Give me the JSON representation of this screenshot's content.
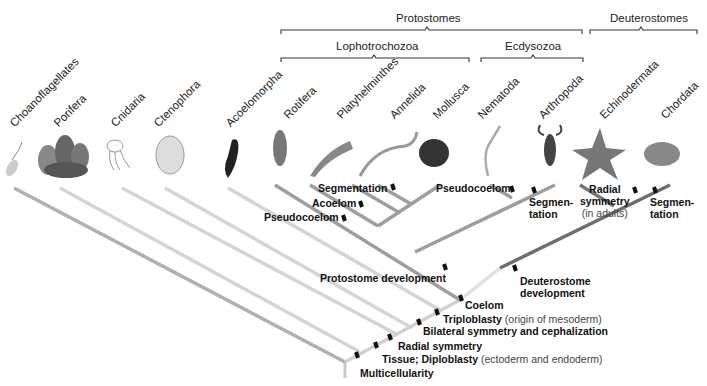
{
  "groups": {
    "protostomes": "Protostomes",
    "deuterostomes": "Deuterostomes",
    "lophotrochozoa": "Lophotrochozoa",
    "ecdysozoa": "Ecdysozoa"
  },
  "taxa": [
    {
      "name": "Choanoflagellates",
      "icon": "choanoflagellate-icon"
    },
    {
      "name": "Porifera",
      "icon": "sponge-icon"
    },
    {
      "name": "Cnidaria",
      "icon": "jellyfish-icon"
    },
    {
      "name": "Ctenophora",
      "icon": "comb-jelly-icon"
    },
    {
      "name": "Acoelomorpha",
      "icon": "acoel-worm-icon"
    },
    {
      "name": "Rotifera",
      "icon": "rotifer-icon"
    },
    {
      "name": "Platyhelminthes",
      "icon": "flatworm-icon"
    },
    {
      "name": "Annelida",
      "icon": "segmented-worm-icon"
    },
    {
      "name": "Mollusca",
      "icon": "snail-shell-icon"
    },
    {
      "name": "Nematoda",
      "icon": "roundworm-icon"
    },
    {
      "name": "Arthropoda",
      "icon": "scorpion-icon"
    },
    {
      "name": "Echinodermata",
      "icon": "starfish-icon"
    },
    {
      "name": "Chordata",
      "icon": "frog-icon"
    }
  ],
  "traits": {
    "segmentation_lopho": "Segmentation",
    "acoelom": "Acoelom",
    "pseudocoelom_lopho": "Pseudocoelom",
    "pseudocoelom_ecdy": "Pseudocoelom",
    "segmentation_arthro_1": "Segmen-",
    "segmentation_arthro_2": "tation",
    "radial_echino_1": "Radial",
    "radial_echino_2": "symmetry",
    "radial_echino_3": "(in adults)",
    "segmentation_chord_1": "Segmen-",
    "segmentation_chord_2": "tation",
    "protostome_dev": "Protostome development",
    "deuterostome_dev_1": "Deuterostome",
    "deuterostome_dev_2": "development",
    "coelom": "Coelom",
    "triploblasty": "Triploblasty",
    "triploblasty_note": " (origin of mesoderm)",
    "bilateral": "Bilateral symmetry and cephalization",
    "radial": "Radial symmetry",
    "tissue": "Tissue; Diploblasty",
    "tissue_note": " (ectoderm and endoderm)",
    "multicellularity": "Multicellularity"
  },
  "colors": {
    "outer_branch": "#b0b0b0",
    "light_branch": "#d6d6d6",
    "proto_branch": "#9a9a9a",
    "deutero_branch": "#6e6e6e",
    "tick": "#111111"
  }
}
